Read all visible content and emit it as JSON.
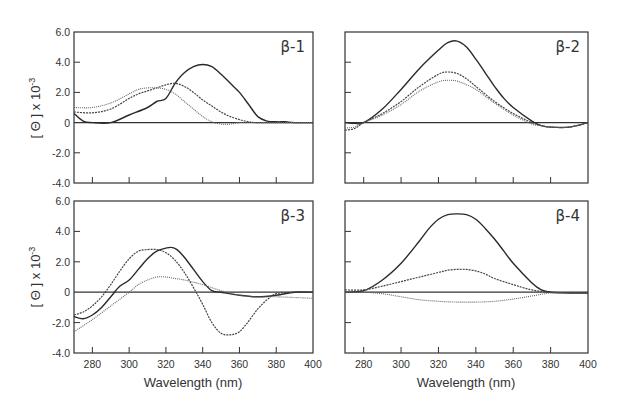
{
  "chart_data": [
    {
      "type": "line",
      "panel": "β-1",
      "xlabel": "",
      "ylabel": "[ Θ ] x 10-3",
      "xlim": [
        270,
        400
      ],
      "ylim": [
        -4.0,
        6.0
      ],
      "xticks": [
        280,
        300,
        320,
        340,
        360,
        380,
        400
      ],
      "yticks": [
        "6.0",
        "4.0",
        "2.0",
        "0",
        "-2.0",
        "-4.0"
      ],
      "series": [
        {
          "name": "solid",
          "style": "solid",
          "x": [
            270,
            275,
            280,
            290,
            300,
            310,
            315,
            320,
            325,
            330,
            335,
            340,
            345,
            350,
            355,
            360,
            365,
            370,
            375,
            380,
            385,
            390,
            400
          ],
          "y": [
            0.6,
            0.1,
            0.0,
            0.0,
            0.5,
            1.0,
            1.4,
            1.6,
            2.6,
            3.3,
            3.7,
            3.85,
            3.7,
            3.2,
            2.6,
            2.0,
            1.2,
            0.4,
            0.1,
            0.05,
            0.05,
            0.0,
            0.0
          ]
        },
        {
          "name": "dashed",
          "style": "dashed",
          "x": [
            270,
            280,
            290,
            300,
            305,
            310,
            315,
            320,
            325,
            330,
            335,
            340,
            345,
            350,
            355,
            360,
            365,
            370,
            380,
            390,
            400
          ],
          "y": [
            0.7,
            0.65,
            0.9,
            1.6,
            1.9,
            2.1,
            2.3,
            2.5,
            2.6,
            2.4,
            2.0,
            1.5,
            1.1,
            0.7,
            0.4,
            0.2,
            0.05,
            0.0,
            0.0,
            0.0,
            0.0
          ]
        },
        {
          "name": "dotted",
          "style": "dotted",
          "x": [
            270,
            280,
            290,
            300,
            305,
            310,
            315,
            320,
            325,
            330,
            335,
            340,
            345,
            350,
            355,
            360,
            370,
            380,
            400
          ],
          "y": [
            1.0,
            1.0,
            1.3,
            1.9,
            2.2,
            2.3,
            2.3,
            2.2,
            1.9,
            1.4,
            0.9,
            0.4,
            0.05,
            -0.1,
            -0.1,
            0.0,
            0.0,
            0.0,
            0.0
          ]
        }
      ]
    },
    {
      "type": "line",
      "panel": "β-2",
      "xlabel": "",
      "ylabel": "",
      "xlim": [
        270,
        400
      ],
      "ylim": [
        -4.0,
        6.0
      ],
      "xticks": [
        280,
        300,
        320,
        340,
        360,
        380,
        400
      ],
      "yticks": [],
      "series": [
        {
          "name": "solid",
          "style": "solid",
          "x": [
            270,
            275,
            280,
            290,
            300,
            310,
            320,
            325,
            330,
            335,
            340,
            345,
            350,
            355,
            360,
            370,
            375,
            380,
            390,
            400
          ],
          "y": [
            0.0,
            -0.05,
            0.0,
            0.9,
            2.2,
            3.6,
            4.8,
            5.3,
            5.4,
            5.0,
            4.2,
            3.3,
            2.4,
            1.6,
            1.0,
            0.1,
            -0.2,
            -0.3,
            -0.3,
            0.0
          ]
        },
        {
          "name": "dashed",
          "style": "dashed",
          "x": [
            270,
            275,
            280,
            290,
            300,
            310,
            320,
            325,
            330,
            335,
            340,
            350,
            360,
            370,
            375,
            380,
            390,
            400
          ],
          "y": [
            -0.5,
            -0.4,
            0.0,
            0.6,
            1.4,
            2.4,
            3.2,
            3.35,
            3.25,
            2.9,
            2.4,
            1.4,
            0.6,
            0.0,
            -0.2,
            -0.3,
            -0.3,
            0.0
          ]
        },
        {
          "name": "dotted",
          "style": "dotted",
          "x": [
            270,
            275,
            280,
            290,
            300,
            310,
            320,
            325,
            330,
            335,
            340,
            350,
            360,
            370,
            375,
            380,
            390,
            400
          ],
          "y": [
            -0.35,
            -0.3,
            0.0,
            0.5,
            1.2,
            2.1,
            2.7,
            2.8,
            2.75,
            2.5,
            2.2,
            1.3,
            0.5,
            -0.1,
            -0.2,
            -0.3,
            -0.3,
            0.0
          ]
        }
      ]
    },
    {
      "type": "line",
      "panel": "β-3",
      "xlabel": "Wavelength (nm)",
      "ylabel": "[ Θ ] x 10-3",
      "xlim": [
        270,
        400
      ],
      "ylim": [
        -4.0,
        6.0
      ],
      "xticks": [
        280,
        300,
        320,
        340,
        360,
        380,
        400
      ],
      "yticks": [
        "6.0",
        "4.0",
        "2.0",
        "0",
        "-2.0",
        "-4.0"
      ],
      "series": [
        {
          "name": "solid",
          "style": "solid",
          "x": [
            270,
            275,
            280,
            285,
            290,
            295,
            300,
            305,
            310,
            315,
            320,
            323,
            326,
            330,
            335,
            340,
            345,
            350,
            360,
            370,
            380,
            390,
            400
          ],
          "y": [
            -1.6,
            -1.75,
            -1.5,
            -1.0,
            -0.3,
            0.4,
            0.8,
            1.5,
            2.2,
            2.7,
            2.9,
            2.95,
            2.8,
            2.3,
            1.5,
            0.7,
            0.1,
            0.0,
            -0.2,
            -0.3,
            -0.2,
            0.0,
            0.0
          ]
        },
        {
          "name": "dashed",
          "style": "dashed",
          "x": [
            270,
            275,
            280,
            285,
            290,
            295,
            300,
            305,
            310,
            315,
            320,
            325,
            330,
            335,
            340,
            345,
            350,
            355,
            360,
            365,
            370,
            375,
            380,
            390,
            400
          ],
          "y": [
            -1.5,
            -1.3,
            -0.9,
            -0.3,
            0.5,
            1.4,
            2.2,
            2.7,
            2.8,
            2.8,
            2.6,
            2.1,
            1.3,
            0.3,
            -0.8,
            -2.0,
            -2.7,
            -2.8,
            -2.6,
            -1.9,
            -1.1,
            -0.5,
            -0.1,
            0.0,
            0.0
          ]
        },
        {
          "name": "dotted",
          "style": "dotted",
          "x": [
            270,
            280,
            290,
            300,
            305,
            310,
            315,
            320,
            325,
            330,
            340,
            350,
            360,
            370,
            380,
            390,
            400
          ],
          "y": [
            -2.6,
            -1.8,
            -0.9,
            0.0,
            0.5,
            0.8,
            1.0,
            1.0,
            0.9,
            0.8,
            0.5,
            0.1,
            -0.2,
            -0.3,
            -0.3,
            -0.35,
            -0.4
          ]
        }
      ]
    },
    {
      "type": "line",
      "panel": "β-4",
      "xlabel": "Wavelength (nm)",
      "ylabel": "",
      "xlim": [
        270,
        400
      ],
      "ylim": [
        -4.0,
        6.0
      ],
      "xticks": [
        280,
        300,
        320,
        340,
        360,
        380,
        400
      ],
      "yticks": [],
      "series": [
        {
          "name": "solid",
          "style": "solid",
          "x": [
            270,
            280,
            290,
            300,
            310,
            315,
            320,
            325,
            330,
            335,
            340,
            345,
            350,
            355,
            360,
            370,
            375,
            380,
            390,
            400
          ],
          "y": [
            0.0,
            0.1,
            0.8,
            1.9,
            3.4,
            4.2,
            4.8,
            5.1,
            5.15,
            5.1,
            4.8,
            4.2,
            3.5,
            2.7,
            1.9,
            0.6,
            0.15,
            0.0,
            -0.05,
            -0.05
          ]
        },
        {
          "name": "dashed",
          "style": "dashed",
          "x": [
            270,
            280,
            290,
            300,
            310,
            320,
            325,
            330,
            335,
            340,
            345,
            350,
            360,
            370,
            380,
            390,
            400
          ],
          "y": [
            0.15,
            0.15,
            0.4,
            0.7,
            1.0,
            1.3,
            1.45,
            1.5,
            1.5,
            1.4,
            1.2,
            0.9,
            0.5,
            0.15,
            0.0,
            -0.05,
            -0.05
          ]
        },
        {
          "name": "dotted",
          "style": "dotted",
          "x": [
            270,
            280,
            290,
            300,
            310,
            320,
            330,
            340,
            350,
            360,
            370,
            380,
            390,
            400
          ],
          "y": [
            0.0,
            0.0,
            -0.1,
            -0.3,
            -0.5,
            -0.6,
            -0.65,
            -0.65,
            -0.6,
            -0.45,
            -0.25,
            -0.05,
            -0.05,
            -0.05
          ]
        }
      ]
    }
  ],
  "figure": {
    "panel_labels": [
      "β-1",
      "β-2",
      "β-3",
      "β-4"
    ],
    "ylabel_main": "[ Θ ] x 10",
    "ylabel_exp": "-3",
    "xlabel": "Wavelength (nm)"
  }
}
